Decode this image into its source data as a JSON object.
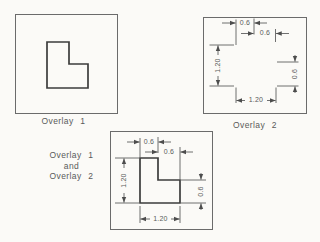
{
  "colors": {
    "background": "#fbfaf7",
    "panel_border": "#6b6b6b",
    "shape_line": "#3c3c3c",
    "dim_line": "#4d4d4d",
    "text": "#5a5a5a"
  },
  "overlay1": {
    "caption": "Overlay 1"
  },
  "overlay2": {
    "caption": "Overlay 2",
    "dims": {
      "stem_width": "0.6",
      "notch_width": "0.6",
      "height": "1.20",
      "right_height": "0.6",
      "width": "1.20"
    }
  },
  "combined": {
    "caption_lines": [
      "Overlay 1",
      "and",
      "Overlay 2"
    ],
    "dims": {
      "stem_width": "0.6",
      "notch_width": "0.6",
      "height": "1.20",
      "right_height": "0.6",
      "width": "1.20"
    }
  }
}
